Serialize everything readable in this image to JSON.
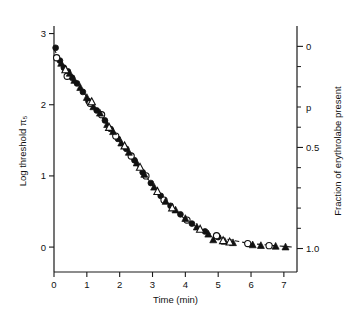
{
  "chart_data": {
    "type": "scatter",
    "title": "",
    "xlabel": "Time (min)",
    "ylabel": "Log threshold π₅",
    "y2label": "Fraction of erythrolabe present",
    "y2_inline_label": "p",
    "xlim": [
      0,
      7.4
    ],
    "ylim": [
      -0.35,
      3.05
    ],
    "y2lim": [
      0,
      1.0
    ],
    "grid": false,
    "legend": "none",
    "xticks": [
      0,
      1,
      2,
      3,
      4,
      5,
      6,
      7
    ],
    "xticklabels": [
      "0",
      "1",
      "2",
      "3",
      "4",
      "5",
      "6",
      "7"
    ],
    "yticks": [
      0,
      1,
      2,
      3
    ],
    "yticklabels": [
      "0",
      "1",
      "2",
      "3"
    ],
    "y2ticks": [
      0,
      0.1,
      0.2,
      0.3,
      0.4,
      0.5,
      0.6,
      0.7,
      0.8,
      0.9,
      1.0
    ],
    "y2ticklabels_major": {
      "0": "0",
      "0.5": "0.5",
      "1": "1.0"
    },
    "y2_axis_inverted": true,
    "series": [
      {
        "name": "filled-circle",
        "marker": "filled-circle",
        "points": [
          [
            0.05,
            2.8
          ],
          [
            0.18,
            2.62
          ],
          [
            0.3,
            2.52
          ],
          [
            0.42,
            2.47
          ],
          [
            0.55,
            2.38
          ],
          [
            0.7,
            2.3
          ],
          [
            0.88,
            2.18
          ],
          [
            1.05,
            2.05
          ],
          [
            1.3,
            1.92
          ],
          [
            1.55,
            1.78
          ],
          [
            1.72,
            1.66
          ],
          [
            1.95,
            1.52
          ],
          [
            2.2,
            1.38
          ],
          [
            2.45,
            1.22
          ],
          [
            2.7,
            1.05
          ],
          [
            2.95,
            0.9
          ],
          [
            3.25,
            0.72
          ],
          [
            3.55,
            0.58
          ],
          [
            3.85,
            0.46
          ],
          [
            4.2,
            0.33
          ],
          [
            4.6,
            0.22
          ],
          [
            5.0,
            0.14
          ]
        ]
      },
      {
        "name": "open-circle",
        "marker": "open-circle",
        "points": [
          [
            0.08,
            2.66
          ],
          [
            0.4,
            2.4
          ],
          [
            1.1,
            2.02
          ],
          [
            1.45,
            1.86
          ],
          [
            1.88,
            1.56
          ],
          [
            2.35,
            1.28
          ],
          [
            2.8,
            1.0
          ],
          [
            3.35,
            0.66
          ],
          [
            4.05,
            0.38
          ],
          [
            4.95,
            0.16
          ],
          [
            5.9,
            0.05
          ],
          [
            6.55,
            0.02
          ]
        ]
      },
      {
        "name": "filled-triangle",
        "marker": "filled-triangle",
        "points": [
          [
            0.22,
            2.58
          ],
          [
            0.48,
            2.44
          ],
          [
            0.62,
            2.34
          ],
          [
            0.8,
            2.24
          ],
          [
            1.0,
            2.1
          ],
          [
            1.2,
            1.97
          ],
          [
            1.4,
            1.88
          ],
          [
            1.62,
            1.72
          ],
          [
            1.8,
            1.62
          ],
          [
            2.05,
            1.46
          ],
          [
            2.28,
            1.33
          ],
          [
            2.52,
            1.18
          ],
          [
            2.75,
            1.02
          ],
          [
            3.05,
            0.84
          ],
          [
            3.4,
            0.64
          ],
          [
            3.7,
            0.52
          ],
          [
            4.0,
            0.4
          ],
          [
            4.35,
            0.28
          ],
          [
            4.7,
            0.18
          ],
          [
            4.85,
            0.1
          ],
          [
            5.2,
            0.08
          ],
          [
            5.45,
            0.06
          ],
          [
            6.05,
            0.03
          ],
          [
            6.3,
            0.02
          ],
          [
            6.75,
            0.01
          ],
          [
            7.05,
            0.0
          ]
        ]
      },
      {
        "name": "open-triangle",
        "marker": "open-triangle",
        "points": [
          [
            0.35,
            2.49
          ],
          [
            1.15,
            2.04
          ],
          [
            1.68,
            1.68
          ],
          [
            2.15,
            1.42
          ],
          [
            2.62,
            1.12
          ],
          [
            3.15,
            0.78
          ],
          [
            3.6,
            0.55
          ],
          [
            4.45,
            0.25
          ],
          [
            5.35,
            0.07
          ],
          [
            5.15,
            0.09
          ]
        ]
      }
    ],
    "fit_curve": {
      "style": "dashed",
      "points": [
        [
          0.0,
          2.78
        ],
        [
          0.25,
          2.58
        ],
        [
          0.5,
          2.42
        ],
        [
          0.75,
          2.27
        ],
        [
          1.0,
          2.11
        ],
        [
          1.25,
          1.95
        ],
        [
          1.5,
          1.8
        ],
        [
          1.75,
          1.64
        ],
        [
          2.0,
          1.48
        ],
        [
          2.25,
          1.33
        ],
        [
          2.5,
          1.17
        ],
        [
          2.75,
          1.02
        ],
        [
          3.0,
          0.87
        ],
        [
          3.25,
          0.73
        ],
        [
          3.5,
          0.6
        ],
        [
          3.75,
          0.49
        ],
        [
          4.0,
          0.39
        ],
        [
          4.25,
          0.31
        ],
        [
          4.5,
          0.24
        ],
        [
          4.75,
          0.19
        ],
        [
          5.0,
          0.14
        ],
        [
          5.5,
          0.09
        ],
        [
          6.0,
          0.05
        ],
        [
          6.5,
          0.03
        ],
        [
          7.0,
          0.01
        ],
        [
          7.3,
          0.0
        ]
      ]
    }
  }
}
